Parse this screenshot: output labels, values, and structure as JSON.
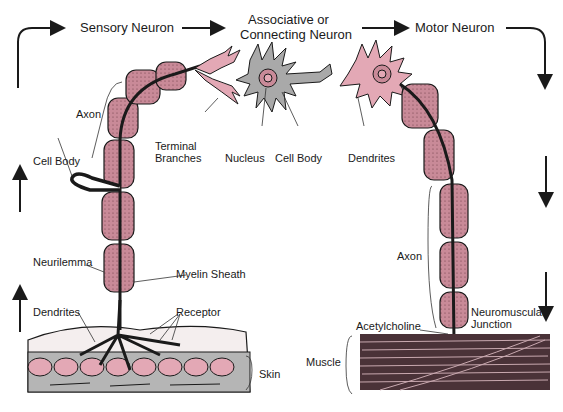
{
  "titles": {
    "sensory": "Sensory Neuron",
    "associative_line1": "Associative or",
    "associative_line2": "Connecting Neuron",
    "motor": "Motor Neuron"
  },
  "labels": {
    "axon_left": "Axon",
    "cell_body_left": "Cell Body",
    "terminal_line1": "Terminal",
    "terminal_line2": "Branches",
    "nucleus": "Nucleus",
    "cell_body_center": "Cell Body",
    "dendrites_top": "Dendrites",
    "neurilemma": "Neurilemma",
    "myelin_sheath": "Myelin Sheath",
    "dendrites_bottom": "Dendrites",
    "receptor": "Receptor",
    "skin": "Skin",
    "axon_right": "Axon",
    "neuromuscular_line1": "Neuromuscular",
    "neuromuscular_line2": "Junction",
    "acetylcholine": "Acetylcholine",
    "muscle": "Muscle"
  },
  "colors": {
    "myelin": "#c98a98",
    "myelin_light": "#e8b9c3",
    "interneuron": "#a9a9a9",
    "skin_gray": "#b5b5b5",
    "muscle": "#3a2a2e",
    "ink": "#1a1a1a"
  }
}
